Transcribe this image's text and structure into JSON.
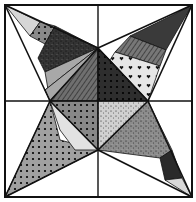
{
  "image": {
    "title": "Star quilt block",
    "width": 196,
    "height": 202,
    "background": "#ffffff",
    "stroke": "#111111"
  },
  "frame": {
    "x1": 5,
    "y1": 5,
    "x2": 192,
    "y2": 197
  },
  "grid": {
    "vx": 98,
    "hy": 101
  },
  "diamond": {
    "top": [
      98,
      48
    ],
    "right": [
      148,
      101
    ],
    "bottom": [
      98,
      150
    ],
    "left": [
      50,
      101
    ],
    "center": [
      98,
      101
    ]
  },
  "arms": [
    {
      "name": "top-left",
      "tip": [
        5,
        5
      ],
      "pieces": [
        {
          "pts": [
            [
              5,
              5
            ],
            [
              40,
              22
            ],
            [
              30,
              36
            ]
          ],
          "fill": "#d6d6d6",
          "pattern": "none"
        },
        {
          "pts": [
            [
              40,
              22
            ],
            [
              55,
              26
            ],
            [
              45,
              44
            ],
            [
              30,
              36
            ]
          ],
          "fill": "#8a8a8a",
          "pattern": "dots"
        },
        {
          "pts": [
            [
              55,
              26
            ],
            [
              98,
              48
            ],
            [
              45,
              72
            ],
            [
              38,
              58
            ],
            [
              45,
              44
            ]
          ],
          "fill": "#333333",
          "pattern": "speckle"
        },
        {
          "pts": [
            [
              98,
              48
            ],
            [
              45,
              72
            ],
            [
              50,
              101
            ],
            [
              45,
              90
            ]
          ],
          "fill": "#a8a8a8",
          "pattern": "none"
        },
        {
          "pts": [
            [
              98,
              48
            ],
            [
              50,
              101
            ],
            [
              45,
              90
            ]
          ],
          "fill": "#a8a8a8",
          "pattern": "none"
        }
      ]
    },
    {
      "name": "top-right",
      "tip": [
        192,
        5
      ],
      "pieces": [
        {
          "pts": [
            [
              192,
              5
            ],
            [
              178,
              16
            ],
            [
              185,
              12
            ]
          ],
          "fill": "#9a9a9a",
          "pattern": "stripes"
        },
        {
          "pts": [
            [
              192,
              5
            ],
            [
              175,
              14
            ],
            [
              130,
              36
            ],
            [
              166,
              50
            ]
          ],
          "fill": "#3a3a3a",
          "pattern": "none"
        },
        {
          "pts": [
            [
              130,
              36
            ],
            [
              166,
              50
            ],
            [
              160,
              66
            ],
            [
              115,
              52
            ]
          ],
          "fill": "#777777",
          "pattern": "stripes"
        },
        {
          "pts": [
            [
              115,
              52
            ],
            [
              160,
              66
            ],
            [
              148,
              101
            ],
            [
              125,
              84
            ],
            [
              110,
              60
            ]
          ],
          "fill": "#e6e6e6",
          "pattern": "hearts"
        },
        {
          "pts": [
            [
              98,
              48
            ],
            [
              110,
              60
            ],
            [
              148,
              101
            ],
            [
              140,
              101
            ]
          ],
          "fill": "#8e8e8e",
          "pattern": "none"
        }
      ]
    },
    {
      "name": "bottom-left",
      "tip": [
        5,
        197
      ],
      "pieces": [
        {
          "pts": [
            [
              5,
              197
            ],
            [
              50,
              101
            ],
            [
              60,
              140
            ],
            [
              98,
              150
            ]
          ],
          "fill": "#a0a0a0",
          "pattern": "dots"
        },
        {
          "pts": [
            [
              50,
              101
            ],
            [
              60,
              130
            ],
            [
              75,
              150
            ],
            [
              98,
              150
            ],
            [
              80,
              112
            ]
          ],
          "fill": "#e2e2e2",
          "pattern": "none"
        }
      ]
    },
    {
      "name": "bottom-right",
      "tip": [
        192,
        197
      ],
      "pieces": [
        {
          "pts": [
            [
              148,
              101
            ],
            [
              98,
              150
            ],
            [
              160,
              158
            ],
            [
              172,
              150
            ]
          ],
          "fill": "#8c8c8c",
          "pattern": "speckle"
        },
        {
          "pts": [
            [
              160,
              158
            ],
            [
              172,
              150
            ],
            [
              182,
              178
            ],
            [
              165,
              180
            ]
          ],
          "fill": "#2a2a2a",
          "pattern": "none"
        },
        {
          "pts": [
            [
              165,
              180
            ],
            [
              182,
              178
            ],
            [
              192,
              197
            ]
          ],
          "fill": "#d8d8d8",
          "pattern": "none"
        }
      ]
    }
  ],
  "center": [
    {
      "name": "center-top-left",
      "pts": [
        [
          98,
          48
        ],
        [
          98,
          101
        ],
        [
          50,
          101
        ]
      ],
      "fill": "#6f6f6f",
      "pattern": "stripes"
    },
    {
      "name": "center-top-right",
      "pts": [
        [
          98,
          48
        ],
        [
          148,
          101
        ],
        [
          98,
          101
        ]
      ],
      "fill": "#2e2e2e",
      "pattern": "dots"
    },
    {
      "name": "center-bottom-left",
      "pts": [
        [
          50,
          101
        ],
        [
          98,
          101
        ],
        [
          98,
          150
        ]
      ],
      "fill": "#888888",
      "pattern": "dots"
    },
    {
      "name": "center-bottom-right",
      "pts": [
        [
          98,
          101
        ],
        [
          148,
          101
        ],
        [
          98,
          150
        ]
      ],
      "fill": "#d0d0d0",
      "pattern": "speckle"
    }
  ],
  "edge_pieces": [
    {
      "name": "left-upper-band",
      "pts": [
        [
          50,
          101
        ],
        [
          98,
          48
        ],
        [
          80,
          112
        ]
      ],
      "fill": "#9c9c9c",
      "pattern": "dots"
    },
    {
      "name": "right-lower-band",
      "pts": [
        [
          148,
          101
        ],
        [
          120,
          101
        ],
        [
          98,
          150
        ],
        [
          130,
          130
        ]
      ],
      "fill": "#9a9a9a",
      "pattern": "zigzag"
    }
  ]
}
